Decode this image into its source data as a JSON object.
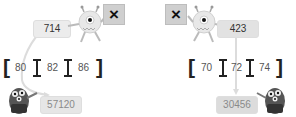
{
  "left_problem": {
    "operator": "×",
    "multiplicand": "714",
    "options": [
      "80",
      "82",
      "86"
    ],
    "result": "57120"
  },
  "right_problem": {
    "operator": "×",
    "multiplicand": "423",
    "options": [
      "70",
      "72",
      "74"
    ],
    "result": "30456"
  },
  "icons": {
    "top_monster": "one-eyed-monster-icon",
    "bottom_monster": "three-eyed-monster-icon",
    "operator_sign": "multiply-sign-icon"
  }
}
